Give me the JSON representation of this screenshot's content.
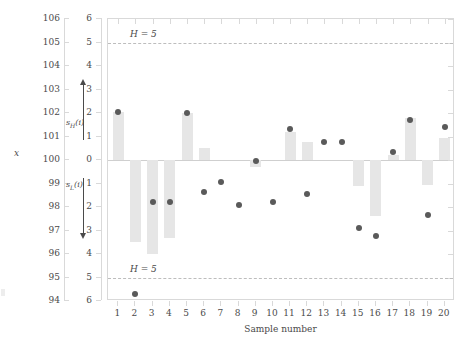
{
  "chart_data": {
    "type": "bar",
    "title": "",
    "subtitle": "",
    "xlabel": "Sample number",
    "ylabel": "x",
    "secondary_ylabel": "cusum",
    "x": [
      1,
      2,
      3,
      4,
      5,
      6,
      7,
      8,
      9,
      10,
      11,
      12,
      13,
      14,
      15,
      16,
      17,
      18,
      19,
      20
    ],
    "categories": [
      "1",
      "2",
      "3",
      "4",
      "5",
      "6",
      "7",
      "8",
      "9",
      "10",
      "11",
      "12",
      "13",
      "14",
      "15",
      "16",
      "17",
      "18",
      "19",
      "20"
    ],
    "xlim": [
      0.4,
      20.6
    ],
    "ylim": [
      94,
      106
    ],
    "secondary_ylim": [
      -6,
      6
    ],
    "grid": false,
    "legend": null,
    "series": [
      {
        "name": "cusum bar",
        "type": "bar",
        "values": [
          2.05,
          -3.5,
          -4.0,
          -3.3,
          2.0,
          0.5,
          0.0,
          0.0,
          -0.3,
          0.0,
          1.2,
          0.75,
          0.0,
          0.0,
          -1.1,
          -2.4,
          0.2,
          1.8,
          -1.05,
          0.95
        ]
      },
      {
        "name": "individual observation x",
        "type": "scatter",
        "values_x": [
          102.1,
          96.45,
          98.25,
          98.25,
          102.0,
          98.7,
          99.05,
          98.1,
          99.95,
          98.2,
          101.3,
          98.55,
          100.75,
          100.75,
          97.1,
          96.75,
          100.35,
          101.7,
          97.65,
          101.4
        ],
        "values_cusum_scale": [
          2.05,
          -5.7,
          -1.8,
          -1.8,
          2.0,
          -1.35,
          -0.95,
          -1.9,
          -0.05,
          -1.8,
          1.3,
          -1.45,
          0.75,
          0.75,
          -2.9,
          -3.25,
          0.35,
          1.7,
          -2.35,
          1.4
        ]
      }
    ],
    "decision_interval": {
      "label": "H = 5",
      "upper_value": 5,
      "lower_value": -5,
      "line_style": "dashed"
    },
    "annotations": [
      {
        "name": "s_H(i)",
        "label_html": "s<sub>H</sub>(i)",
        "direction": "up",
        "from": 0.8,
        "to": 3.2
      },
      {
        "name": "s_L(i)",
        "label_html": "s<sub>L</sub>(i)",
        "direction": "down",
        "from": -0.8,
        "to": -3.2
      }
    ],
    "primary_axis_ticks": [
      94,
      95,
      96,
      97,
      98,
      99,
      100,
      101,
      102,
      103,
      104,
      105,
      106
    ],
    "secondary_axis_ticks": [
      6,
      5,
      4,
      3,
      2,
      1,
      0,
      1,
      2,
      3,
      4,
      5,
      6
    ],
    "colors": {
      "bar_fill": "#e6e6e6",
      "point_fill": "#5a5a5a",
      "axis": "#d9d9d9",
      "limit_line": "#bdbdbd",
      "text": "#4a4a4a",
      "background": "#ffffff"
    }
  },
  "axes": {
    "x_title": "Sample number",
    "y_title": "x",
    "primary_tick_labels": [
      "106",
      "105",
      "104",
      "103",
      "102",
      "101",
      "100",
      "99",
      "98",
      "97",
      "96",
      "95",
      "94"
    ],
    "secondary_tick_labels": [
      "6",
      "5",
      "4",
      "3",
      "2",
      "1",
      "0",
      "1",
      "2",
      "3",
      "4",
      "5",
      "6"
    ],
    "x_tick_labels": [
      "1",
      "2",
      "3",
      "4",
      "5",
      "6",
      "7",
      "8",
      "9",
      "10",
      "11",
      "12",
      "13",
      "14",
      "15",
      "16",
      "17",
      "18",
      "19",
      "20"
    ]
  },
  "labels": {
    "h_upper": "H = 5",
    "h_lower": "H = 5",
    "s_high": "s",
    "s_high_sub": "H",
    "s_high_arg": "(i)",
    "s_low": "s",
    "s_low_sub": "L",
    "s_low_arg": "(i)"
  }
}
